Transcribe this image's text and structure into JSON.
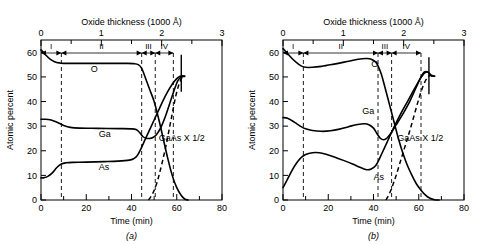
{
  "figure": {
    "panels": [
      {
        "caption": "(a)",
        "axes": {
          "x_bottom": {
            "label": "Time (min)",
            "min": 0,
            "max": 80,
            "major_ticks": [
              0,
              20,
              40,
              60,
              80
            ],
            "minor_ticks": [
              10,
              30,
              50,
              70
            ],
            "tick_labels": [
              "0",
              "20",
              "40",
              "60",
              "80"
            ]
          },
          "x_top": {
            "label": "Oxide thickness (1000 Å)",
            "min": 0,
            "max": 3,
            "major_ticks": [
              0,
              1,
              2,
              3
            ],
            "minor_ticks": [
              0.5,
              1.5,
              2.5
            ],
            "tick_labels": [
              "0",
              "1",
              "2",
              "3"
            ]
          },
          "y_left": {
            "label": "Atomic percent",
            "min": 0,
            "max": 65,
            "major_ticks": [
              0,
              10,
              20,
              30,
              40,
              50,
              60
            ],
            "tick_labels": [
              "0",
              "10",
              "20",
              "30",
              "40",
              "50",
              "60"
            ]
          }
        },
        "regions": [
          {
            "name": "I",
            "start": 0,
            "end": 9
          },
          {
            "name": "II",
            "start": 9,
            "end": 44.5
          },
          {
            "name": "III",
            "start": 44.5,
            "end": 50.5
          },
          {
            "name": "IV",
            "start": 50.5,
            "end": 58.5
          }
        ],
        "boundaries": [
          9,
          44.5,
          50.5,
          58.5
        ],
        "end_bar": {
          "x": 62,
          "y_low": 44,
          "y_high": 59
        },
        "series": [
          {
            "name": "O",
            "label": "O",
            "style": "solid",
            "label_at": {
              "x": 22,
              "y": 52
            },
            "points": [
              [
                0,
                61
              ],
              [
                1,
                60
              ],
              [
                2,
                59
              ],
              [
                4,
                57.2
              ],
              [
                6,
                56.2
              ],
              [
                8,
                55.7
              ],
              [
                10,
                55.5
              ],
              [
                20,
                55.5
              ],
              [
                30,
                55.5
              ],
              [
                38,
                55.5
              ],
              [
                41,
                55.4
              ],
              [
                43,
                55.0
              ],
              [
                44.5,
                53.5
              ],
              [
                46,
                50
              ],
              [
                48,
                45
              ],
              [
                50,
                40
              ],
              [
                52,
                33
              ],
              [
                54,
                25
              ],
              [
                56,
                17
              ],
              [
                58,
                10
              ],
              [
                60,
                5
              ],
              [
                62,
                1.8
              ],
              [
                63.5,
                0.4
              ],
              [
                65,
                0
              ]
            ]
          },
          {
            "name": "Ga",
            "label": "Ga",
            "style": "solid",
            "label_at": {
              "x": 25.5,
              "y": 25.5
            },
            "points": [
              [
                0,
                32.8
              ],
              [
                2,
                32.8
              ],
              [
                4,
                32.6
              ],
              [
                6,
                32.0
              ],
              [
                8,
                31.2
              ],
              [
                10,
                30.3
              ],
              [
                13,
                29.5
              ],
              [
                17,
                29.2
              ],
              [
                25,
                29.1
              ],
              [
                35,
                29.0
              ],
              [
                40,
                28.9
              ],
              [
                42,
                28.6
              ],
              [
                43.5,
                27.5
              ],
              [
                45,
                25.8
              ],
              [
                46.5,
                25.1
              ],
              [
                48,
                25.0
              ],
              [
                49.5,
                25.4
              ],
              [
                51,
                26.5
              ],
              [
                53,
                29.5
              ],
              [
                55,
                34
              ],
              [
                57,
                39.5
              ],
              [
                59,
                45
              ],
              [
                60.5,
                48.5
              ],
              [
                62,
                50
              ],
              [
                63.5,
                50.2
              ]
            ]
          },
          {
            "name": "As",
            "label": "As",
            "style": "solid",
            "label_at": {
              "x": 25.5,
              "y": 12
            },
            "points": [
              [
                0,
                9.0
              ],
              [
                1.5,
                9.1
              ],
              [
                3,
                9.6
              ],
              [
                5,
                11
              ],
              [
                7,
                13.2
              ],
              [
                9,
                14.6
              ],
              [
                11,
                15.1
              ],
              [
                14,
                15.3
              ],
              [
                20,
                15.4
              ],
              [
                28,
                15.6
              ],
              [
                34,
                15.8
              ],
              [
                39,
                16.2
              ],
              [
                41,
                16.8
              ],
              [
                42.5,
                18
              ],
              [
                44,
                20.5
              ],
              [
                46,
                24.5
              ],
              [
                48,
                28.5
              ],
              [
                50,
                32.5
              ],
              [
                52,
                36.5
              ],
              [
                54,
                40.5
              ],
              [
                56,
                44
              ],
              [
                58,
                47
              ],
              [
                60,
                49.3
              ],
              [
                61.5,
                50.3
              ],
              [
                63.5,
                50.4
              ]
            ]
          },
          {
            "name": "GaAs",
            "label": "GaAs X 1/2",
            "style": "dashed",
            "label_at": {
              "x": 52,
              "y": 24
            },
            "points": [
              [
                47.5,
                0
              ],
              [
                49,
                2
              ],
              [
                50.5,
                5
              ],
              [
                52,
                9.5
              ],
              [
                53.5,
                15
              ],
              [
                55,
                21
              ],
              [
                56.5,
                28
              ],
              [
                58,
                35
              ],
              [
                59.5,
                42
              ],
              [
                61,
                47
              ],
              [
                62.5,
                50
              ],
              [
                63.5,
                50.4
              ]
            ]
          }
        ]
      },
      {
        "caption": "(b)",
        "axes": {
          "x_bottom": {
            "label": "Time (min)",
            "min": 0,
            "max": 80,
            "major_ticks": [
              0,
              20,
              40,
              60,
              80
            ],
            "minor_ticks": [
              10,
              30,
              50,
              70
            ],
            "tick_labels": [
              "0",
              "20",
              "40",
              "60",
              "80"
            ]
          },
          "x_top": {
            "label": "Oxide thickness (1000 Å)",
            "min": 0,
            "max": 3,
            "major_ticks": [
              0,
              1,
              2,
              3
            ],
            "minor_ticks": [
              0.5,
              1.5,
              2.5
            ],
            "tick_labels": [
              "0",
              "1",
              "2",
              "3"
            ]
          },
          "y_left": {
            "label": "Atomic percent",
            "min": 0,
            "max": 65,
            "major_ticks": [
              0,
              10,
              20,
              30,
              40,
              50,
              60
            ],
            "tick_labels": [
              "0",
              "10",
              "20",
              "30",
              "40",
              "50",
              "60"
            ]
          }
        },
        "regions": [
          {
            "name": "I",
            "start": 0,
            "end": 9
          },
          {
            "name": "II",
            "start": 9,
            "end": 42
          },
          {
            "name": "III",
            "start": 42,
            "end": 48
          },
          {
            "name": "IV",
            "start": 48,
            "end": 61
          }
        ],
        "boundaries": [
          9,
          42,
          48,
          61
        ],
        "end_bar": {
          "x": 64.5,
          "y_low": 43,
          "y_high": 58
        },
        "series": [
          {
            "name": "O",
            "label": "O",
            "style": "solid",
            "label_at": {
              "x": 39,
              "y": 54
            },
            "points": [
              [
                0,
                61.5
              ],
              [
                1,
                60.5
              ],
              [
                2,
                59.5
              ],
              [
                4,
                57.5
              ],
              [
                6,
                55.8
              ],
              [
                8,
                54.5
              ],
              [
                10,
                53.9
              ],
              [
                13,
                53.9
              ],
              [
                17,
                54.3
              ],
              [
                22,
                55.1
              ],
              [
                27,
                56.0
              ],
              [
                31,
                56.8
              ],
              [
                35,
                57.4
              ],
              [
                37,
                57.5
              ],
              [
                39,
                57.2
              ],
              [
                41,
                56
              ],
              [
                42,
                54.5
              ],
              [
                43.5,
                51
              ],
              [
                45,
                46
              ],
              [
                47,
                39
              ],
              [
                49,
                32
              ],
              [
                51,
                25
              ],
              [
                53,
                19
              ],
              [
                55,
                14
              ],
              [
                57,
                10
              ],
              [
                59,
                6.5
              ],
              [
                61,
                4
              ],
              [
                63,
                2
              ],
              [
                65,
                0.7
              ],
              [
                67,
                0.1
              ],
              [
                69,
                0
              ]
            ]
          },
          {
            "name": "Ga",
            "label": "Ga",
            "style": "solid",
            "label_at": {
              "x": 35,
              "y": 35
            },
            "points": [
              [
                0,
                33.5
              ],
              [
                2,
                33.2
              ],
              [
                4,
                32.2
              ],
              [
                6,
                31.0
              ],
              [
                8,
                29.8
              ],
              [
                10,
                28.9
              ],
              [
                13,
                28.2
              ],
              [
                17,
                27.9
              ],
              [
                21,
                28.1
              ],
              [
                25,
                28.8
              ],
              [
                29,
                29.8
              ],
              [
                33,
                30.7
              ],
              [
                36,
                31.0
              ],
              [
                38,
                30.6
              ],
              [
                40,
                29.2
              ],
              [
                41.5,
                27.0
              ],
              [
                43,
                25.1
              ],
              [
                44.5,
                24.5
              ],
              [
                46,
                25.2
              ],
              [
                48,
                27.5
              ],
              [
                50,
                30.5
              ],
              [
                53,
                35
              ],
              [
                56,
                40
              ],
              [
                59,
                46
              ],
              [
                61,
                50
              ],
              [
                62.5,
                52
              ],
              [
                64,
                52
              ],
              [
                65.5,
                50.6
              ],
              [
                67,
                50.3
              ]
            ]
          },
          {
            "name": "As",
            "label": "As",
            "style": "solid",
            "label_at": {
              "x": 40,
              "y": 8
            },
            "points": [
              [
                0,
                5.0
              ],
              [
                2,
                8.5
              ],
              [
                4,
                12
              ],
              [
                6,
                15
              ],
              [
                8,
                17.2
              ],
              [
                10,
                18.5
              ],
              [
                13,
                19.2
              ],
              [
                16,
                19.2
              ],
              [
                19,
                18.6
              ],
              [
                23,
                17.4
              ],
              [
                27,
                16.0
              ],
              [
                31,
                14.5
              ],
              [
                34,
                13.3
              ],
              [
                37,
                12.3
              ],
              [
                39,
                12.6
              ],
              [
                41,
                14
              ],
              [
                43,
                17.5
              ],
              [
                45,
                21.5
              ],
              [
                47,
                25.5
              ],
              [
                49,
                29.5
              ],
              [
                52,
                35
              ],
              [
                55,
                40
              ],
              [
                58,
                45
              ],
              [
                60.5,
                49
              ],
              [
                62.5,
                51.5
              ],
              [
                64,
                52
              ],
              [
                65.5,
                50.6
              ],
              [
                67,
                50.3
              ]
            ]
          },
          {
            "name": "GaAs",
            "label": "GaAs X 1/2",
            "style": "dashed",
            "label_at": {
              "x": 50.5,
              "y": 24
            },
            "points": [
              [
                45.5,
                0
              ],
              [
                47,
                2.5
              ],
              [
                48.5,
                6
              ],
              [
                50,
                10
              ],
              [
                52,
                16
              ],
              [
                54,
                22
              ],
              [
                56,
                28
              ],
              [
                58,
                34.5
              ],
              [
                60,
                41
              ],
              [
                62,
                46.5
              ],
              [
                64,
                50
              ],
              [
                65.5,
                50.6
              ],
              [
                67,
                50.3
              ]
            ]
          }
        ]
      }
    ]
  }
}
